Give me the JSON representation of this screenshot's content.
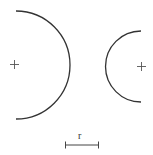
{
  "diagram": {
    "stroke_color": "#333333",
    "left_arc": {
      "center": [
        14,
        65
      ],
      "radius": 54,
      "label": "large arc (convex right)"
    },
    "right_arc": {
      "center": [
        141,
        67
      ],
      "radius": 35,
      "label": "small arc (convex left)"
    },
    "scale_bar": {
      "label": "r",
      "x1": 65,
      "x2": 99,
      "y": 145
    }
  }
}
